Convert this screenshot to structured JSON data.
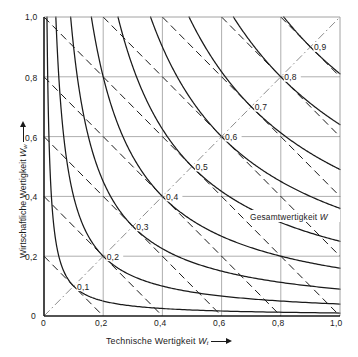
{
  "chart_data": {
    "type": "line",
    "title": "",
    "xlabel": "Technische Wertigkeit Wₜ",
    "ylabel": "Wirtschaftliche Wertigkeit Wᵥᵥ",
    "xlabel_text": "Technische Wertigkeit",
    "xlabel_symbol": "W",
    "xlabel_symbol_sub": "t",
    "ylabel_text": "Wirtschaftliche Wertigkeit",
    "ylabel_symbol": "W",
    "ylabel_symbol_sub": "w",
    "xlim": [
      0,
      1
    ],
    "ylim": [
      0,
      1
    ],
    "xticks": [
      "0",
      "0,2",
      "0,4",
      "0,6",
      "0,8",
      "1,0"
    ],
    "xtick_values": [
      0,
      0.2,
      0.4,
      0.6,
      0.8,
      1.0
    ],
    "yticks": [
      "0",
      "0,2",
      "0,4",
      "0,6",
      "0,8",
      "1,0"
    ],
    "ytick_values": [
      0,
      0.2,
      0.4,
      0.6,
      0.8,
      1.0
    ],
    "grid": true,
    "annotation": "Gesamtwertigkeit W",
    "annotation_text": "Gesamtwertigkeit",
    "annotation_symbol": "W",
    "legend_position": "none",
    "series": [
      {
        "name": "Gesamtwertigkeit W (geometrisches Mittel)",
        "style": "solid",
        "formula": "W = sqrt(Wt * Ww)",
        "levels": [
          0.1,
          0.2,
          0.3,
          0.4,
          0.5,
          0.6,
          0.7,
          0.8,
          0.9
        ]
      },
      {
        "name": "Gesamtwertigkeit W (arithmetisches Mittel)",
        "style": "dashed",
        "formula": "W = (Wt + Ww) / 2",
        "levels": [
          0.1,
          0.2,
          0.3,
          0.4,
          0.5,
          0.6,
          0.7,
          0.8,
          0.9
        ]
      },
      {
        "name": "Wt = Ww Diagonale",
        "style": "dash-dot",
        "formula": "Ww = Wt",
        "levels": []
      }
    ],
    "contour_labels": [
      {
        "value": "0,1",
        "x": 0.1,
        "y": 0.1
      },
      {
        "value": "0,2",
        "x": 0.2,
        "y": 0.2
      },
      {
        "value": "0,3",
        "x": 0.3,
        "y": 0.3
      },
      {
        "value": "0,4",
        "x": 0.4,
        "y": 0.4
      },
      {
        "value": "0,5",
        "x": 0.5,
        "y": 0.5
      },
      {
        "value": "0,6",
        "x": 0.6,
        "y": 0.6
      },
      {
        "value": "0,7",
        "x": 0.7,
        "y": 0.7
      },
      {
        "value": "0,8",
        "x": 0.8,
        "y": 0.8
      },
      {
        "value": "0,9",
        "x": 0.9,
        "y": 0.9
      }
    ],
    "colors": {
      "curve": "#1a1a1a",
      "grid": "#8c8c8c",
      "axis": "#1a1a1a",
      "diagonal": "#6e6e6e",
      "background": "#ffffff"
    }
  }
}
